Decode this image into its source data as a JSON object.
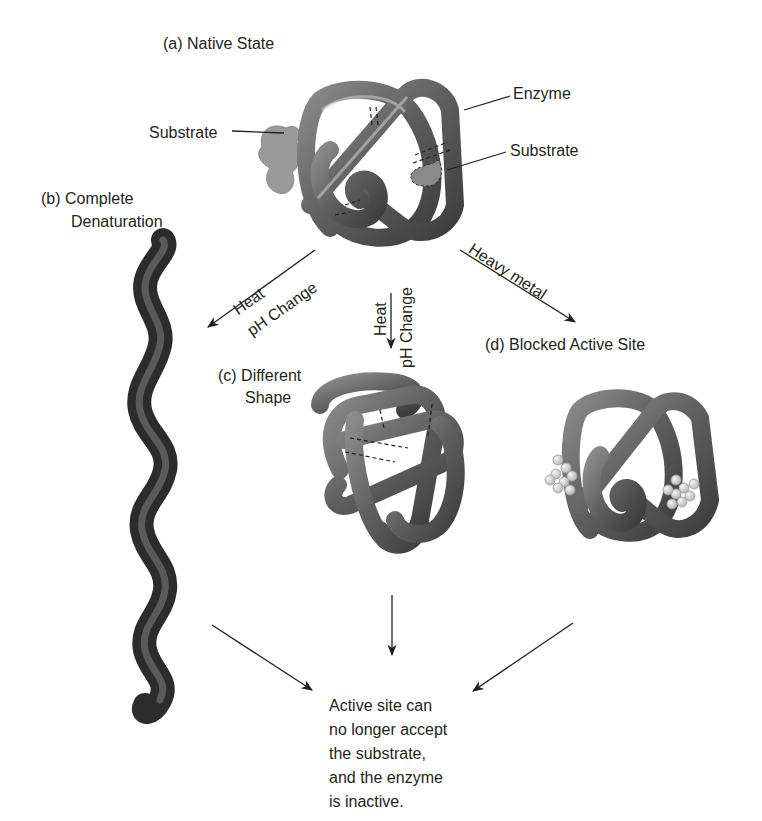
{
  "panels": {
    "a": {
      "label": "(a) Native State",
      "enzyme_label": "Enzyme",
      "substrate_left_label": "Substrate",
      "substrate_right_label": "Substrate"
    },
    "b": {
      "label_line1": "(b) Complete",
      "label_line2": "Denaturation"
    },
    "c": {
      "label_line1": "(c) Different",
      "label_line2": "Shape"
    },
    "d": {
      "label": "(d) Blocked Active Site"
    }
  },
  "arrows": {
    "to_b": {
      "above": "Heat",
      "below": "pH Change"
    },
    "to_c": {
      "left": "Heat",
      "right": "pH Change"
    },
    "to_d": {
      "label": "Heavy metal"
    }
  },
  "result": {
    "lines": [
      "Active site can",
      "no longer accept",
      "the substrate,",
      "and the enzyme",
      "is inactive."
    ]
  },
  "colors": {
    "protein_dark": "#4a4a4a",
    "protein_mid": "#7a7a7a",
    "protein_light": "#a8a8a8",
    "substrate": "#9a9a9a",
    "metal": "#d6d6d6",
    "text": "#231f20"
  }
}
